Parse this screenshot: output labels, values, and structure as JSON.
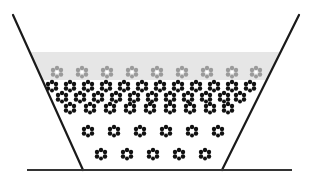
{
  "diagram": {
    "title": "",
    "colors": {
      "background": "#ffffff",
      "wall": "#1a1a1a",
      "base": "#333333",
      "liquid_band": "#e6e6e6",
      "particle_gray": "#9a9a9a",
      "particle_black": "#111111"
    },
    "vessel": {
      "left_wall": {
        "x1": 13,
        "y1": 15,
        "x2": 83,
        "y2": 170
      },
      "right_wall": {
        "x1": 299,
        "y1": 15,
        "x2": 222,
        "y2": 170
      },
      "base": {
        "x1": 27,
        "y1": 170,
        "x2": 292,
        "y2": 170
      }
    },
    "liquid_band": {
      "top_y": 52,
      "bottom_y": 80
    },
    "rows": [
      {
        "name": "surface-gray-row",
        "color": "gray",
        "y": 72,
        "xs": [
          57,
          82,
          107,
          132,
          157,
          182,
          207,
          232,
          256
        ]
      },
      {
        "name": "packed-row-1",
        "color": "black",
        "y": 86,
        "xs": [
          52,
          70,
          88,
          106,
          124,
          142,
          160,
          178,
          196,
          214,
          232,
          250
        ]
      },
      {
        "name": "packed-row-2",
        "color": "black",
        "y": 97,
        "xs": [
          62,
          80,
          98,
          116,
          134,
          152,
          170,
          188,
          206,
          224,
          240
        ]
      },
      {
        "name": "packed-row-3",
        "color": "black",
        "y": 108,
        "xs": [
          70,
          90,
          110,
          130,
          150,
          170,
          190,
          210,
          228
        ]
      },
      {
        "name": "loose-row-1",
        "color": "black",
        "y": 131,
        "xs": [
          88,
          114,
          140,
          166,
          192,
          218
        ]
      },
      {
        "name": "loose-row-2",
        "color": "black",
        "y": 154,
        "xs": [
          101,
          127,
          153,
          179,
          205
        ]
      }
    ]
  }
}
